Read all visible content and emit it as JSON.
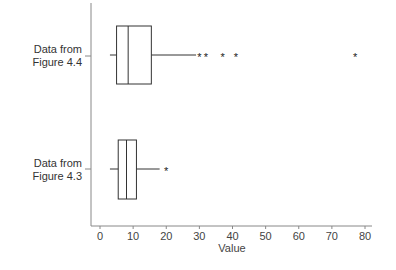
{
  "chart_data": {
    "type": "boxplot",
    "title": "",
    "xlabel": "Value",
    "ylabel": "",
    "xlim": [
      0,
      80
    ],
    "xticks": [
      0,
      10,
      20,
      30,
      40,
      50,
      60,
      70,
      80
    ],
    "grid": false,
    "legend": null,
    "orientation": "horizontal",
    "series": [
      {
        "name": "Data from Figure 4.4",
        "label_line1": "Data from",
        "label_line2": "Figure 4.4",
        "whisker_low": 3,
        "q1": 5,
        "median": 8.5,
        "q3": 15.5,
        "whisker_high": 29,
        "outliers": [
          30,
          32,
          37,
          41,
          77
        ]
      },
      {
        "name": "Data from Figure 4.3",
        "label_line1": "Data from",
        "label_line2": "Figure 4.3",
        "whisker_low": 3,
        "q1": 5.5,
        "median": 8,
        "q3": 11,
        "whisker_high": 18,
        "outliers": [
          20
        ]
      }
    ]
  },
  "labels": {
    "cat1_line1": "Data from",
    "cat1_line2": "Figure 4.4",
    "cat2_line1": "Data from",
    "cat2_line2": "Figure 4.3",
    "xlabel": "Value",
    "outlier_marker": "*"
  }
}
